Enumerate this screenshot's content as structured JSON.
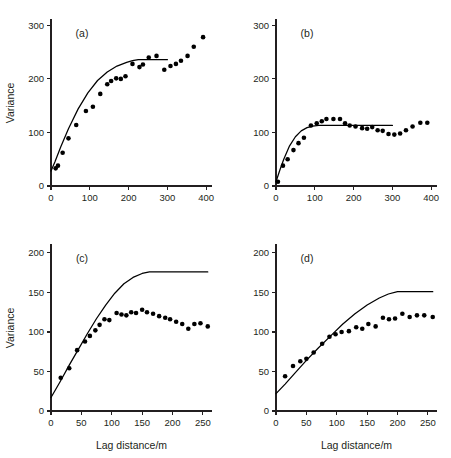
{
  "figure": {
    "background": "#ffffff",
    "ink_color": "#231f20",
    "point_color": "#000000"
  },
  "chart_data": [
    {
      "type": "scatter",
      "panel_label": "(a)",
      "title": "",
      "xlabel": "",
      "ylabel": "Variance",
      "xlim": [
        0,
        415
      ],
      "ylim": [
        0,
        310
      ],
      "xticks": [
        0,
        100,
        200,
        300,
        400
      ],
      "yticks": [
        0,
        100,
        200,
        300
      ],
      "xtick_labels": [
        "0",
        "100",
        "200",
        "300",
        "400"
      ],
      "ytick_labels": [
        "0",
        "100",
        "200",
        "300"
      ],
      "grid": false,
      "legend": "none",
      "series": [
        {
          "name": "experimental variogram",
          "marker": "filled-circle",
          "x": [
            12,
            18,
            30,
            45,
            65,
            90,
            108,
            127,
            145,
            155,
            168,
            180,
            192,
            210,
            228,
            237,
            252,
            272,
            292,
            308,
            322,
            335,
            352,
            368,
            392
          ],
          "y": [
            33,
            38,
            62,
            89,
            114,
            140,
            148,
            172,
            190,
            196,
            201,
            200,
            205,
            228,
            222,
            227,
            240,
            243,
            217,
            224,
            228,
            234,
            243,
            260,
            278
          ]
        },
        {
          "name": "fitted model",
          "type": "line",
          "x": [
            0,
            10,
            25,
            45,
            70,
            95,
            120,
            145,
            170,
            195,
            210,
            225,
            245,
            265,
            285,
            300
          ],
          "y": [
            28,
            45,
            73,
            107,
            144,
            174,
            197,
            213,
            224,
            231,
            234,
            236,
            236,
            236,
            236,
            236
          ]
        }
      ]
    },
    {
      "type": "scatter",
      "panel_label": "(b)",
      "title": "",
      "xlabel": "",
      "ylabel": "",
      "xlim": [
        0,
        415
      ],
      "ylim": [
        0,
        310
      ],
      "xticks": [
        0,
        100,
        200,
        300,
        400
      ],
      "yticks": [
        0,
        100,
        200,
        300
      ],
      "xtick_labels": [
        "0",
        "100",
        "200",
        "300",
        "400"
      ],
      "ytick_labels": [
        "0",
        "100",
        "200",
        "300"
      ],
      "grid": false,
      "legend": "none",
      "series": [
        {
          "name": "experimental variogram",
          "marker": "filled-circle",
          "x": [
            5,
            18,
            30,
            45,
            58,
            72,
            90,
            105,
            118,
            130,
            148,
            165,
            178,
            190,
            205,
            222,
            235,
            248,
            262,
            275,
            290,
            305,
            320,
            335,
            352,
            372,
            390
          ],
          "y": [
            8,
            38,
            50,
            67,
            80,
            90,
            113,
            117,
            121,
            125,
            125,
            125,
            117,
            113,
            111,
            108,
            107,
            110,
            104,
            103,
            97,
            96,
            98,
            104,
            111,
            118,
            118
          ]
        },
        {
          "name": "fitted model",
          "type": "line",
          "x": [
            0,
            10,
            20,
            35,
            50,
            65,
            80,
            95,
            110,
            140,
            180,
            220,
            260,
            300
          ],
          "y": [
            8,
            30,
            50,
            75,
            92,
            103,
            109,
            112,
            113,
            113,
            113,
            113,
            113,
            113
          ]
        }
      ]
    },
    {
      "type": "scatter",
      "panel_label": "(c)",
      "title": "",
      "xlabel": "Lag distance/m",
      "ylabel": "Variance",
      "xlim": [
        0,
        265
      ],
      "ylim": [
        0,
        210
      ],
      "xticks": [
        0,
        50,
        100,
        150,
        200,
        250
      ],
      "yticks": [
        0,
        50,
        100,
        150,
        200
      ],
      "xtick_labels": [
        "0",
        "50",
        "100",
        "150",
        "200",
        "250"
      ],
      "ytick_labels": [
        "0",
        "50",
        "100",
        "150",
        "200"
      ],
      "grid": false,
      "legend": "none",
      "series": [
        {
          "name": "experimental variogram",
          "marker": "filled-circle",
          "x": [
            16,
            30,
            43,
            56,
            64,
            73,
            80,
            88,
            96,
            108,
            116,
            124,
            132,
            140,
            150,
            158,
            168,
            178,
            188,
            196,
            206,
            216,
            226,
            236,
            246,
            258
          ],
          "y": [
            42,
            54,
            77,
            88,
            95,
            102,
            109,
            116,
            115,
            124,
            122,
            121,
            125,
            124,
            128,
            125,
            123,
            120,
            118,
            116,
            113,
            110,
            104,
            110,
            111,
            107
          ]
        },
        {
          "name": "fitted model",
          "type": "line",
          "x": [
            0,
            15,
            30,
            45,
            60,
            75,
            90,
            105,
            120,
            135,
            150,
            162,
            172,
            190,
            215,
            240,
            258
          ],
          "y": [
            17,
            37,
            58,
            78,
            98,
            117,
            134,
            149,
            161,
            169,
            174,
            176,
            176,
            176,
            176,
            176,
            176
          ]
        }
      ]
    },
    {
      "type": "scatter",
      "panel_label": "(d)",
      "title": "",
      "xlabel": "Lag distance/m",
      "ylabel": "",
      "xlim": [
        0,
        265
      ],
      "ylim": [
        0,
        210
      ],
      "xticks": [
        0,
        50,
        100,
        150,
        200,
        250
      ],
      "yticks": [
        0,
        50,
        100,
        150,
        200
      ],
      "xtick_labels": [
        "0",
        "50",
        "100",
        "150",
        "200",
        "250"
      ],
      "ytick_labels": [
        "0",
        "50",
        "100",
        "150",
        "200"
      ],
      "grid": false,
      "legend": "none",
      "series": [
        {
          "name": "experimental variogram",
          "marker": "filled-circle",
          "x": [
            15,
            28,
            40,
            50,
            62,
            76,
            88,
            98,
            108,
            120,
            132,
            142,
            152,
            164,
            176,
            186,
            196,
            208,
            220,
            232,
            244,
            258
          ],
          "y": [
            44,
            57,
            63,
            66,
            74,
            85,
            94,
            97,
            100,
            101,
            106,
            104,
            110,
            107,
            118,
            116,
            117,
            123,
            119,
            121,
            121,
            119
          ]
        },
        {
          "name": "fitted model",
          "type": "line",
          "x": [
            0,
            15,
            30,
            50,
            70,
            90,
            110,
            130,
            150,
            170,
            185,
            200,
            215,
            235,
            258
          ],
          "y": [
            22,
            34,
            47,
            64,
            80,
            95,
            110,
            123,
            134,
            143,
            148,
            151,
            151,
            151,
            151
          ]
        }
      ]
    }
  ]
}
